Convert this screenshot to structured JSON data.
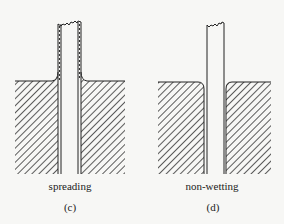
{
  "figure": {
    "panels": [
      {
        "id": "c",
        "caption": "spreading",
        "panel_label": "(c)",
        "description": "Capillary tube in liquid; liquid film spreads up tube walls (dashed film), meniscus curves upward"
      },
      {
        "id": "d",
        "caption": "non-wetting",
        "panel_label": "(d)",
        "description": "Capillary tube in liquid; liquid surface curves away (rounded corners) from tube, no film"
      }
    ],
    "colors": {
      "line": "#222222",
      "hatch": "#333333",
      "background": "#f7f7f5"
    }
  }
}
